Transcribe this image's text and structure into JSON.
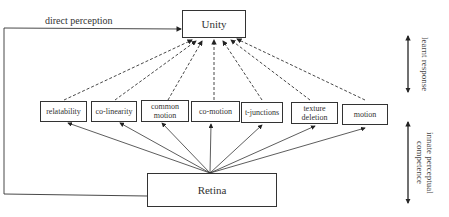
{
  "diagram": {
    "top_node": "Unity",
    "bottom_node": "Retina",
    "direct_label": "direct perception",
    "cues": [
      {
        "id": "relatability",
        "label": "relatability"
      },
      {
        "id": "co-linearity",
        "label": "co-linearity"
      },
      {
        "id": "common-motion",
        "label": "common motion"
      },
      {
        "id": "co-motion",
        "label": "co-motion"
      },
      {
        "id": "t-junctions",
        "label": "t-junctions"
      },
      {
        "id": "texture-deletion",
        "label": "texture deletion"
      },
      {
        "id": "motion",
        "label": "motion"
      }
    ],
    "side_labels": {
      "upper": "learnt response",
      "lower": "innate perceptual competence"
    },
    "colors": {
      "line": "#333333",
      "background": "#ffffff"
    }
  }
}
